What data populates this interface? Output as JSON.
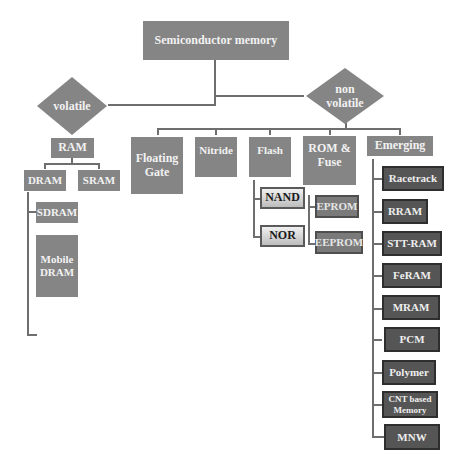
{
  "diagram": {
    "root": "Semiconductor memory",
    "volatile": {
      "label": "volatile",
      "ram": "RAM",
      "dram": "DRAM",
      "sram": "SRAM",
      "sdram": "SDRAM",
      "mobile_dram": "Mobile DRAM"
    },
    "non_volatile": {
      "label": "non volatile",
      "floating_gate": "Floating Gate",
      "nitride": "Nitride",
      "flash": "Flash",
      "nand": "NAND",
      "nor": "NOR",
      "rom_fuse": "ROM & Fuse",
      "eprom": "EPROM",
      "eeprom": "EEPROM",
      "emerging": "Emerging",
      "emerging_items": [
        "Racetrack",
        "RRAM",
        "STT-RAM",
        "FeRAM",
        "MRAM",
        "PCM",
        "Polymer",
        "CNT based Memory",
        "MNW"
      ]
    }
  },
  "colors": {
    "node_gray": "#858585",
    "node_dark": "#555555",
    "connector": "#6e6e6e",
    "background": "#ffffff"
  }
}
